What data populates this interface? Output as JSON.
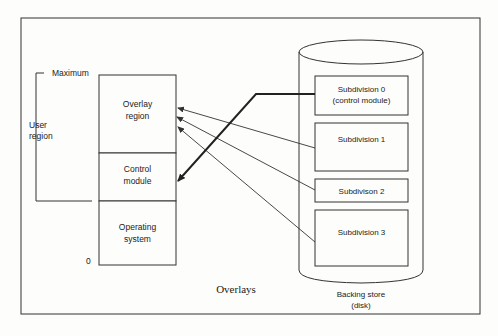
{
  "caption": "Overlays",
  "memory": {
    "maximum_label": "Maximum",
    "zero_label": "0",
    "user_region_label": [
      "User",
      "region"
    ],
    "segments": [
      {
        "id": "overlay-region",
        "lines": [
          "Overlay",
          "region"
        ]
      },
      {
        "id": "control-module",
        "lines": [
          "Control",
          "module"
        ]
      },
      {
        "id": "operating-system",
        "lines": [
          "Operating",
          "system"
        ]
      }
    ]
  },
  "backing_store": {
    "label": [
      "Backing store",
      "(disk)"
    ],
    "subdivisions": [
      {
        "id": "subdivision-0",
        "lines": [
          "Subdivision 0",
          "(control module)"
        ]
      },
      {
        "id": "subdivision-1",
        "lines": [
          "Subdivision 1"
        ]
      },
      {
        "id": "subdivision-2",
        "lines": [
          "Subdivison 2"
        ]
      },
      {
        "id": "subdivision-3",
        "lines": [
          "Subdivision 3"
        ]
      }
    ]
  },
  "arrows": [
    {
      "from": "subdivision-0",
      "to": "control-module",
      "style": "thick"
    },
    {
      "from": "subdivision-1",
      "to": "overlay-region",
      "style": "thin"
    },
    {
      "from": "subdivision-2",
      "to": "overlay-region",
      "style": "thin"
    },
    {
      "from": "subdivision-3",
      "to": "overlay-region",
      "style": "thin"
    }
  ]
}
